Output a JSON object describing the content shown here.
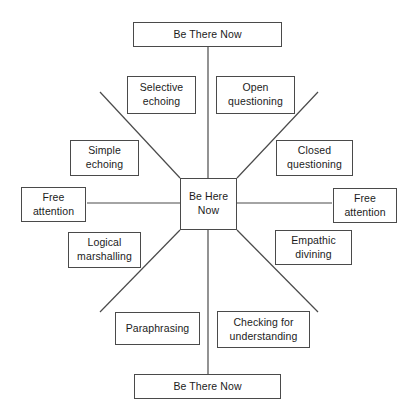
{
  "diagram": {
    "canvas": {
      "width": 417,
      "height": 417,
      "background": "#ffffff"
    },
    "line_color": "#4a4a4a",
    "text_color": "#1b1b1b",
    "center": {
      "id": "be-here-now",
      "label": "Be Here\nNow",
      "x": 180,
      "y": 178,
      "w": 57,
      "h": 52
    },
    "axis_ends": [
      {
        "id": "top-be-there-now",
        "label": "Be There Now",
        "x": 133,
        "y": 22,
        "w": 149,
        "h": 25
      },
      {
        "id": "bottom-be-there-now",
        "label": "Be There Now",
        "x": 134,
        "y": 374,
        "w": 147,
        "h": 25
      },
      {
        "id": "left-free-attention",
        "label": "Free\nattention",
        "x": 21,
        "y": 187,
        "w": 65,
        "h": 35
      },
      {
        "id": "right-free-attention",
        "label": "Free\nattention",
        "x": 333,
        "y": 188,
        "w": 64,
        "h": 35
      }
    ],
    "skills": [
      {
        "id": "selective-echoing",
        "label": "Selective\nechoing",
        "x": 127,
        "y": 76,
        "w": 69,
        "h": 38
      },
      {
        "id": "open-questioning",
        "label": "Open\nquestioning",
        "x": 216,
        "y": 76,
        "w": 79,
        "h": 38
      },
      {
        "id": "simple-echoing",
        "label": "Simple\nechoing",
        "x": 70,
        "y": 140,
        "w": 69,
        "h": 36
      },
      {
        "id": "closed-questioning",
        "label": "Closed\nquestioning",
        "x": 276,
        "y": 140,
        "w": 77,
        "h": 36
      },
      {
        "id": "logical-marshalling",
        "label": "Logical\nmarshalling",
        "x": 68,
        "y": 232,
        "w": 73,
        "h": 36
      },
      {
        "id": "empathic-divining",
        "label": "Empathic\ndivining",
        "x": 275,
        "y": 230,
        "w": 77,
        "h": 35
      },
      {
        "id": "paraphrasing",
        "label": "Paraphrasing",
        "x": 115,
        "y": 312,
        "w": 85,
        "h": 33
      },
      {
        "id": "checking-for-understanding",
        "label": "Checking for\nunderstanding",
        "x": 217,
        "y": 311,
        "w": 93,
        "h": 37
      }
    ],
    "spokes": [
      {
        "id": "spoke-vertical-top",
        "x1": 208,
        "y1": 47,
        "x2": 208,
        "y2": 178
      },
      {
        "id": "spoke-vertical-bottom",
        "x1": 208,
        "y1": 230,
        "x2": 208,
        "y2": 374
      },
      {
        "id": "spoke-horizontal-left",
        "x1": 87,
        "y1": 203,
        "x2": 180,
        "y2": 203
      },
      {
        "id": "spoke-horizontal-right",
        "x1": 237,
        "y1": 203,
        "x2": 332,
        "y2": 203
      },
      {
        "id": "spoke-diagonal-upper-left",
        "x1": 100,
        "y1": 92,
        "x2": 180,
        "y2": 178
      },
      {
        "id": "spoke-diagonal-upper-right",
        "x1": 318,
        "y1": 92,
        "x2": 237,
        "y2": 178
      },
      {
        "id": "spoke-diagonal-lower-left",
        "x1": 100,
        "y1": 312,
        "x2": 180,
        "y2": 230
      },
      {
        "id": "spoke-diagonal-lower-right",
        "x1": 318,
        "y1": 312,
        "x2": 237,
        "y2": 230
      }
    ]
  }
}
